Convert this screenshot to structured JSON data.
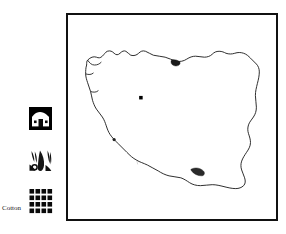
{
  "figure": {
    "background_color": "#ffffff",
    "width": 286,
    "height": 234
  },
  "map": {
    "name": "iran-map",
    "frame": {
      "border_color": "#111111",
      "border_width_px": 2,
      "fill_color": "#ffffff",
      "left": 66,
      "top": 13,
      "width": 212,
      "height": 208
    },
    "country": {
      "name": "Iran",
      "outline_color": "#1a1a1a",
      "fill_color": "#ffffff",
      "outline_width_px": 0.9
    },
    "interior_features": {
      "label": "rivers and lakes",
      "color": "#bdbdbd",
      "width_px": 0.6
    },
    "capital_marker": {
      "label": "capital city",
      "color": "#000000",
      "shape": "square-dot",
      "size_px": 3.2
    },
    "coastal_marks": {
      "label": "dark coastal highlights",
      "color": "#2b2b2b"
    }
  },
  "legend": {
    "name": "map-legend",
    "items": [
      {
        "id": "settlement",
        "label": "",
        "icon": "house-icon",
        "icon_description": "black square tile with white house silhouette, door and two windows",
        "color": "#000000"
      },
      {
        "id": "crop",
        "label": "",
        "icon": "crop-leaf-icon",
        "icon_description": "three dark tapered leaf or boll shapes with a small open circle",
        "color": "#000000"
      },
      {
        "id": "cotton",
        "label": "Cotton",
        "icon": "grid-squares-icon",
        "icon_description": "four by four grid of solid black squares",
        "color": "#000000"
      }
    ]
  }
}
